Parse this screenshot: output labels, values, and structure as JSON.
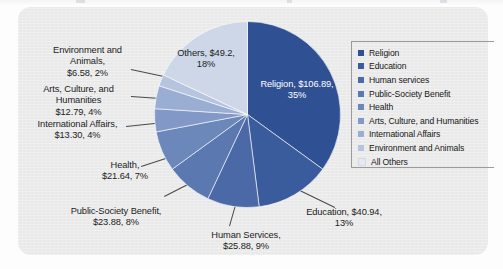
{
  "figure": {
    "panel_bg": "#e9e9e9",
    "page_bg": "#fdfdfd"
  },
  "chart_data": {
    "type": "pie",
    "title": "",
    "subtitle": "",
    "xlabel": "",
    "ylabel": "",
    "legend_position": "right",
    "grid": false,
    "units": "billions of US dollars",
    "start_angle_deg": 0,
    "direction": "clockwise",
    "categories": [
      "Religion",
      "Education",
      "Human services",
      "Public-Society Benefit",
      "Health",
      "Arts, Culture, and Humanities",
      "International Affairs",
      "Environment and Animals",
      "All Others"
    ],
    "values": [
      106.89,
      40.94,
      25.88,
      23.88,
      21.64,
      12.79,
      13.3,
      6.58,
      49.2
    ],
    "percents": [
      35,
      13,
      9,
      8,
      7,
      4,
      4,
      2,
      18
    ],
    "colors": [
      "#2f5193",
      "#3a5c9c",
      "#4a69a6",
      "#5b78b0",
      "#6c87ba",
      "#8298c6",
      "#9aadd2",
      "#b7c4de",
      "#cdd7e8"
    ]
  },
  "slice_labels": [
    {
      "name": "others",
      "text": "Others, $49.2,\n18%"
    },
    {
      "name": "religion",
      "text": "Religion, $106.89,\n35%"
    },
    {
      "name": "education",
      "text": "Education, $40.94,\n13%"
    },
    {
      "name": "human-services",
      "text": "Human Services,\n$25.88, 9%"
    },
    {
      "name": "public-society-benefit",
      "text": "Public-Society Benefit,\n$23.88, 8%"
    },
    {
      "name": "health",
      "text": "Health,\n$21.64, 7%"
    },
    {
      "name": "international-affairs",
      "text": "International Affairs,\n$13.30, 4%"
    },
    {
      "name": "arts-culture-humanities",
      "text": "Arts, Culture, and\nHumanities\n$12.79, 4%"
    },
    {
      "name": "environment-and-animals",
      "text": "Environment and\nAnimals,\n$6.58, 2%"
    }
  ],
  "legend": {
    "items": [
      {
        "label": "Religion",
        "color": "#2f5193"
      },
      {
        "label": "Education",
        "color": "#3a5c9c"
      },
      {
        "label": "Human services",
        "color": "#4a69a6"
      },
      {
        "label": "Public-Society Benefit",
        "color": "#5b78b0"
      },
      {
        "label": "Health",
        "color": "#6c87ba"
      },
      {
        "label": "Arts, Culture, and Humanities",
        "color": "#8298c6"
      },
      {
        "label": "International Affairs",
        "color": "#9aadd2"
      },
      {
        "label": "Environment and Animals",
        "color": "#b7c4de"
      },
      {
        "label": "All Others",
        "color": "#e4e9f2"
      }
    ]
  }
}
